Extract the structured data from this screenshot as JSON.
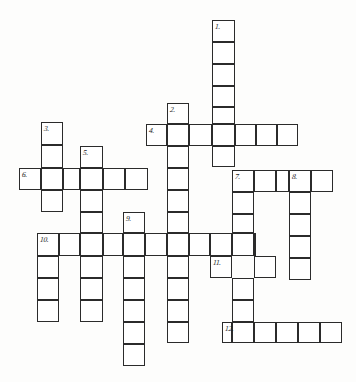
{
  "puzzle": {
    "title": "Crossword puzzle grid",
    "type": "crossword-grid",
    "cell_size": 21.8,
    "stroke_color": "#2b2b2b",
    "cell_fill": "#ffffff",
    "background": "#fdfdfc",
    "entries": [
      {
        "number": "1.",
        "direction": "down",
        "x": 212,
        "y": 20,
        "length": 6
      },
      {
        "number": "2.",
        "direction": "down",
        "x": 167,
        "y": 103,
        "length": 11
      },
      {
        "number": "3.",
        "direction": "down",
        "x": 41,
        "y": 122,
        "length": 4
      },
      {
        "number": "4.",
        "direction": "across",
        "x": 146,
        "y": 124,
        "length": 7
      },
      {
        "number": "5.",
        "direction": "down",
        "x": 80,
        "y": 146,
        "length": 6
      },
      {
        "number": "6.",
        "direction": "across",
        "x": 19,
        "y": 168,
        "length": 6
      },
      {
        "number": "7.",
        "direction": "across",
        "x": 232,
        "y": 170,
        "length": 5
      },
      {
        "number": "7b",
        "direction": "down",
        "x": 232,
        "y": 170,
        "length": 8
      },
      {
        "number": "8.",
        "direction": "down",
        "x": 289,
        "y": 170,
        "length": 5
      },
      {
        "number": "9.",
        "direction": "down",
        "x": 123,
        "y": 212,
        "length": 7
      },
      {
        "number": "10.",
        "direction": "across",
        "x": 37,
        "y": 233,
        "length": 10
      },
      {
        "number": "10b",
        "direction": "down",
        "x": 37,
        "y": 233,
        "length": 5
      },
      {
        "number": "11.",
        "direction": "across",
        "x": 210,
        "y": 256,
        "length": 3
      },
      {
        "number": "12.",
        "direction": "across",
        "x": 222,
        "y": 322,
        "length": 5
      }
    ],
    "numbers": [
      {
        "label": "1.",
        "x": 215,
        "y": 23
      },
      {
        "label": "2.",
        "x": 170,
        "y": 106
      },
      {
        "label": "3.",
        "x": 44,
        "y": 125
      },
      {
        "label": "4.",
        "x": 149,
        "y": 127
      },
      {
        "label": "5.",
        "x": 83,
        "y": 149
      },
      {
        "label": "6.",
        "x": 22,
        "y": 171
      },
      {
        "label": "7.",
        "x": 235,
        "y": 173
      },
      {
        "label": "8.",
        "x": 292,
        "y": 173
      },
      {
        "label": "9.",
        "x": 126,
        "y": 215
      },
      {
        "label": "10.",
        "x": 40,
        "y": 236
      },
      {
        "label": "11.",
        "x": 213,
        "y": 259
      },
      {
        "label": "12.",
        "x": 225,
        "y": 325
      }
    ],
    "cells": [
      {
        "x": 212,
        "y": 20,
        "w": 23,
        "h": 22
      },
      {
        "x": 212,
        "y": 42,
        "w": 23,
        "h": 22
      },
      {
        "x": 212,
        "y": 64,
        "w": 23,
        "h": 22
      },
      {
        "x": 212,
        "y": 86,
        "w": 23,
        "h": 21
      },
      {
        "x": 212,
        "y": 107,
        "w": 23,
        "h": 17
      },
      {
        "x": 212,
        "y": 124,
        "w": 23,
        "h": 22
      },
      {
        "x": 212,
        "y": 146,
        "w": 23,
        "h": 21
      },
      {
        "x": 167,
        "y": 103,
        "w": 22,
        "h": 21
      },
      {
        "x": 167,
        "y": 124,
        "w": 22,
        "h": 22
      },
      {
        "x": 167,
        "y": 146,
        "w": 22,
        "h": 22
      },
      {
        "x": 167,
        "y": 168,
        "w": 22,
        "h": 22
      },
      {
        "x": 167,
        "y": 190,
        "w": 22,
        "h": 22
      },
      {
        "x": 167,
        "y": 212,
        "w": 22,
        "h": 21
      },
      {
        "x": 167,
        "y": 233,
        "w": 22,
        "h": 23
      },
      {
        "x": 167,
        "y": 256,
        "w": 22,
        "h": 22
      },
      {
        "x": 167,
        "y": 278,
        "w": 22,
        "h": 22
      },
      {
        "x": 167,
        "y": 300,
        "w": 22,
        "h": 22
      },
      {
        "x": 167,
        "y": 322,
        "w": 22,
        "h": 21
      },
      {
        "x": 41,
        "y": 122,
        "w": 22,
        "h": 23
      },
      {
        "x": 41,
        "y": 145,
        "w": 22,
        "h": 23
      },
      {
        "x": 41,
        "y": 168,
        "w": 22,
        "h": 22
      },
      {
        "x": 41,
        "y": 190,
        "w": 22,
        "h": 22
      },
      {
        "x": 146,
        "y": 124,
        "w": 21,
        "h": 22
      },
      {
        "x": 189,
        "y": 124,
        "w": 23,
        "h": 22
      },
      {
        "x": 235,
        "y": 124,
        "w": 21,
        "h": 22
      },
      {
        "x": 256,
        "y": 124,
        "w": 21,
        "h": 22
      },
      {
        "x": 277,
        "y": 124,
        "w": 21,
        "h": 22
      },
      {
        "x": 80,
        "y": 146,
        "w": 23,
        "h": 22
      },
      {
        "x": 80,
        "y": 168,
        "w": 23,
        "h": 22
      },
      {
        "x": 80,
        "y": 190,
        "w": 23,
        "h": 22
      },
      {
        "x": 80,
        "y": 212,
        "w": 23,
        "h": 21
      },
      {
        "x": 80,
        "y": 233,
        "w": 23,
        "h": 23
      },
      {
        "x": 80,
        "y": 256,
        "w": 23,
        "h": 22
      },
      {
        "x": 80,
        "y": 278,
        "w": 23,
        "h": 22
      },
      {
        "x": 80,
        "y": 300,
        "w": 23,
        "h": 22
      },
      {
        "x": 19,
        "y": 168,
        "w": 22,
        "h": 22
      },
      {
        "x": 63,
        "y": 168,
        "w": 17,
        "h": 22
      },
      {
        "x": 103,
        "y": 168,
        "w": 22,
        "h": 22
      },
      {
        "x": 125,
        "y": 168,
        "w": 23,
        "h": 22
      },
      {
        "x": 232,
        "y": 170,
        "w": 22,
        "h": 22
      },
      {
        "x": 254,
        "y": 170,
        "w": 22,
        "h": 22
      },
      {
        "x": 276,
        "y": 170,
        "w": 13,
        "h": 22
      },
      {
        "x": 311,
        "y": 170,
        "w": 22,
        "h": 22
      },
      {
        "x": 232,
        "y": 192,
        "w": 22,
        "h": 22
      },
      {
        "x": 232,
        "y": 214,
        "w": 22,
        "h": 19
      },
      {
        "x": 232,
        "y": 233,
        "w": 22,
        "h": 23
      },
      {
        "x": 232,
        "y": 278,
        "w": 22,
        "h": 22
      },
      {
        "x": 232,
        "y": 300,
        "w": 22,
        "h": 22
      },
      {
        "x": 232,
        "y": 322,
        "w": 22,
        "h": 21
      },
      {
        "x": 289,
        "y": 170,
        "w": 22,
        "h": 22
      },
      {
        "x": 289,
        "y": 192,
        "w": 22,
        "h": 22
      },
      {
        "x": 289,
        "y": 214,
        "w": 22,
        "h": 22
      },
      {
        "x": 289,
        "y": 236,
        "w": 22,
        "h": 22
      },
      {
        "x": 289,
        "y": 258,
        "w": 22,
        "h": 22
      },
      {
        "x": 123,
        "y": 212,
        "w": 22,
        "h": 21
      },
      {
        "x": 123,
        "y": 233,
        "w": 22,
        "h": 23
      },
      {
        "x": 123,
        "y": 256,
        "w": 22,
        "h": 22
      },
      {
        "x": 123,
        "y": 278,
        "w": 22,
        "h": 22
      },
      {
        "x": 123,
        "y": 300,
        "w": 22,
        "h": 22
      },
      {
        "x": 123,
        "y": 322,
        "w": 22,
        "h": 22
      },
      {
        "x": 123,
        "y": 344,
        "w": 22,
        "h": 22
      },
      {
        "x": 37,
        "y": 233,
        "w": 22,
        "h": 23
      },
      {
        "x": 59,
        "y": 233,
        "w": 21,
        "h": 23
      },
      {
        "x": 103,
        "y": 233,
        "w": 20,
        "h": 23
      },
      {
        "x": 145,
        "y": 233,
        "w": 22,
        "h": 23
      },
      {
        "x": 189,
        "y": 233,
        "w": 21,
        "h": 23
      },
      {
        "x": 210,
        "y": 233,
        "w": 22,
        "h": 23
      },
      {
        "x": 254,
        "y": 233,
        "w": 1,
        "h": 23
      },
      {
        "x": 37,
        "y": 256,
        "w": 22,
        "h": 22
      },
      {
        "x": 37,
        "y": 278,
        "w": 22,
        "h": 22
      },
      {
        "x": 37,
        "y": 300,
        "w": 22,
        "h": 22
      },
      {
        "x": 210,
        "y": 256,
        "w": 22,
        "h": 22
      },
      {
        "x": 254,
        "y": 256,
        "w": 22,
        "h": 22
      },
      {
        "x": 222,
        "y": 322,
        "w": 10,
        "h": 21
      },
      {
        "x": 254,
        "y": 322,
        "w": 22,
        "h": 21
      },
      {
        "x": 276,
        "y": 322,
        "w": 22,
        "h": 21
      },
      {
        "x": 298,
        "y": 322,
        "w": 22,
        "h": 21
      },
      {
        "x": 320,
        "y": 322,
        "w": 22,
        "h": 21
      }
    ]
  }
}
